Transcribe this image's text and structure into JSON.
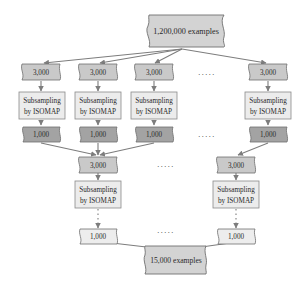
{
  "colors": {
    "background": "#ffffff",
    "top_box": "#d3d3d3",
    "sample_3000": "#c9c9c9",
    "subsample_box": "#ececec",
    "sample_1000_dark": "#a3a3a3",
    "sample_1000_light": "#ededed",
    "final_box": "#d3d3d3",
    "stroke": "#6f6f6f",
    "arrow": "#7d7d7d"
  },
  "source": {
    "label": "1,200,000 examples"
  },
  "level1": {
    "columns": [
      {
        "input": "3,000",
        "process": [
          "Subsampling",
          "by ISOMAP"
        ],
        "output": "1,000"
      },
      {
        "input": "3,000",
        "process": [
          "Subsampling",
          "by ISOMAP"
        ],
        "output": "1,000"
      },
      {
        "input": "3,000",
        "process": [
          "Subsampling",
          "by ISOMAP"
        ],
        "output": "1,000"
      },
      {
        "input": "3,000",
        "process": [
          "Subsampling",
          "by ISOMAP"
        ],
        "output": "1,000"
      }
    ],
    "ellipsis": "....."
  },
  "level2": {
    "columns": [
      {
        "input": "3,000",
        "process": [
          "Subsampling",
          "by ISOMAP"
        ],
        "output": "1,000"
      },
      {
        "input": "3,000",
        "process": [
          "Subsampling",
          "by ISOMAP"
        ],
        "output": "1,000"
      }
    ],
    "ellipsis": "....."
  },
  "result": {
    "label": "15,000 examples"
  }
}
